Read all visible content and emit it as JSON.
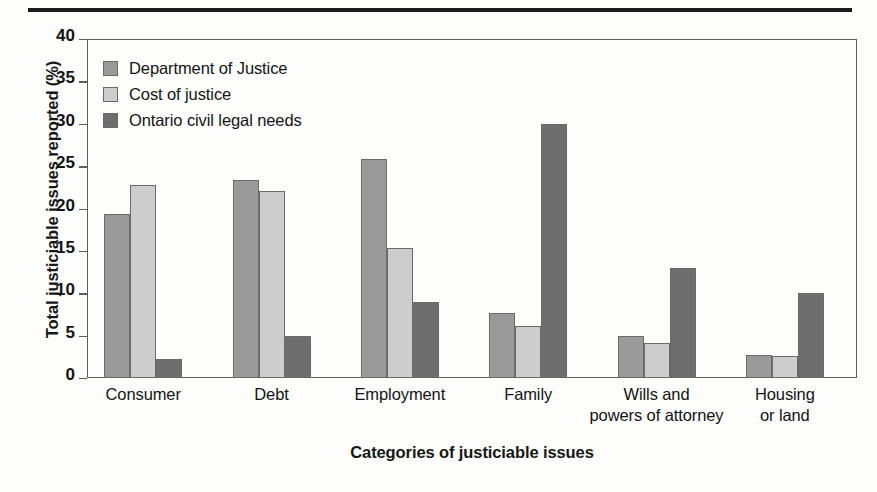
{
  "figure": {
    "top_rule": "horizontal-rule"
  },
  "chart_data": {
    "type": "bar",
    "title": "",
    "xlabel": "Categories of justiciable issues",
    "ylabel": "Total justiciable issues reported (%)",
    "categories": [
      "Consumer",
      "Debt",
      "Employment",
      "Family",
      "Wills and\npowers of attorney",
      "Housing\nor land"
    ],
    "category_lines": [
      [
        "Consumer"
      ],
      [
        "Debt"
      ],
      [
        "Employment"
      ],
      [
        "Family"
      ],
      [
        "Wills and",
        "powers of attorney"
      ],
      [
        "Housing",
        "or land"
      ]
    ],
    "series": [
      {
        "name": "Department of Justice",
        "color": "#9a9a9a",
        "values": [
          19.4,
          23.4,
          25.9,
          7.7,
          5.0,
          2.7
        ]
      },
      {
        "name": "Cost of justice",
        "color": "#cdcdcd",
        "values": [
          22.8,
          22.1,
          15.4,
          6.1,
          4.1,
          2.6
        ]
      },
      {
        "name": "Ontario civil legal needs",
        "color": "#6e6e6e",
        "values": [
          2.2,
          5.0,
          9.0,
          30.0,
          13.0,
          10.0
        ]
      }
    ],
    "ylim": [
      0,
      40
    ],
    "yticks": [
      0,
      5,
      10,
      15,
      20,
      25,
      30,
      35,
      40
    ],
    "ytick_labels": [
      "0",
      "5",
      "10",
      "15",
      "20",
      "25",
      "30",
      "35",
      "40"
    ],
    "grid": false,
    "legend_position": "top-left",
    "legend_entries": [
      "Department of Justice",
      "Cost of justice",
      "Ontario civil legal needs"
    ],
    "legend_colors": [
      "#9a9a9a",
      "#cdcdcd",
      "#6e6e6e"
    ]
  }
}
